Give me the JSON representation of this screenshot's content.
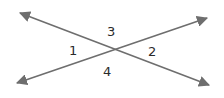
{
  "diagram": {
    "type": "intersecting-lines",
    "line_color": "#6e6e6e",
    "label_color": "#2a2a2a",
    "lines": [
      {
        "name": "line-a",
        "from": [
          20,
          13
        ],
        "to": [
          209,
          85
        ]
      },
      {
        "name": "line-b",
        "from": [
          17,
          83
        ],
        "to": [
          207,
          18
        ]
      }
    ],
    "intersection": [
      115,
      50
    ],
    "angles": [
      {
        "id": "angle-1",
        "label": "1",
        "x": 73,
        "y": 54
      },
      {
        "id": "angle-2",
        "label": "2",
        "x": 152,
        "y": 55
      },
      {
        "id": "angle-3",
        "label": "3",
        "x": 111,
        "y": 35
      },
      {
        "id": "angle-4",
        "label": "4",
        "x": 107,
        "y": 75
      }
    ]
  }
}
